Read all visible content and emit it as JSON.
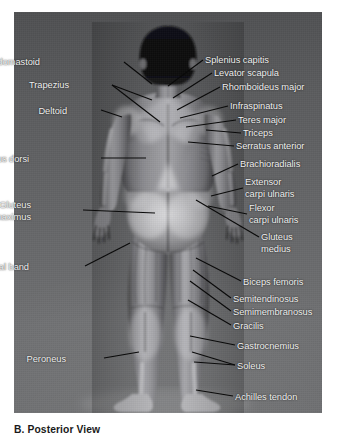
{
  "figure": {
    "caption": "B. Posterior View",
    "view_type": "Posterior View",
    "panel_letter": "B.",
    "colors": {
      "background_top": "#4f5052",
      "background_bottom": "#6e6f71",
      "label_text": "#f2f2f2",
      "leader_line": "#0a0a0a",
      "caption_text": "#1a1a1a",
      "page_background": "#ffffff"
    }
  },
  "labels_left": [
    {
      "id": "sternocleidomastoid",
      "text": "Sternocleidomastoid",
      "x": 40,
      "y": 57
    },
    {
      "id": "trapezius",
      "text": "Trapezius",
      "x": 69,
      "y": 80
    },
    {
      "id": "deltoid",
      "text": "Deltoid",
      "x": 67,
      "y": 106
    },
    {
      "id": "latissimus-dorsi",
      "text": "Latissimus dorsi",
      "x": 29,
      "y": 154
    },
    {
      "id": "gluteus-maximus",
      "text": "Gluteus\nmaximus",
      "x": 31,
      "y": 200
    },
    {
      "id": "iliotibial-band",
      "text": "Iliotibial band",
      "x": 29,
      "y": 262
    },
    {
      "id": "peroneus",
      "text": "Peroneus",
      "x": 66,
      "y": 354
    }
  ],
  "labels_right": [
    {
      "id": "splenius-capitis",
      "text": "Splenius capitis",
      "x": 205,
      "y": 55
    },
    {
      "id": "levator-scapula",
      "text": "Levator scapula",
      "x": 214,
      "y": 68
    },
    {
      "id": "rhomboideus-major",
      "text": "Rhomboideus major",
      "x": 222,
      "y": 82
    },
    {
      "id": "infraspinatus",
      "text": "Infraspinatus",
      "x": 230,
      "y": 101
    },
    {
      "id": "teres-major",
      "text": "Teres major",
      "x": 238,
      "y": 115
    },
    {
      "id": "triceps",
      "text": "Triceps",
      "x": 243,
      "y": 128
    },
    {
      "id": "serratus-anterior",
      "text": "Serratus anterior",
      "x": 236,
      "y": 141
    },
    {
      "id": "brachioradialis",
      "text": "Brachioradialis",
      "x": 240,
      "y": 159
    },
    {
      "id": "extensor-carpi-ulnaris",
      "text": "Extensor\ncarpi ulnaris",
      "x": 245,
      "y": 177
    },
    {
      "id": "flexor-carpi-ulnaris",
      "text": "Flexor\ncarpi ulnaris",
      "x": 249,
      "y": 203
    },
    {
      "id": "gluteus-medius",
      "text": "Gluteus\nmedius",
      "x": 261,
      "y": 232
    },
    {
      "id": "biceps-femoris",
      "text": "Biceps femoris",
      "x": 243,
      "y": 277
    },
    {
      "id": "semitendinosus",
      "text": "Semitendinosus",
      "x": 233,
      "y": 294
    },
    {
      "id": "semimembranosus",
      "text": "Semimembranosus",
      "x": 233,
      "y": 307
    },
    {
      "id": "gracilis",
      "text": "Gracilis",
      "x": 233,
      "y": 321
    },
    {
      "id": "gastrocnemius",
      "text": "Gastrocnemius",
      "x": 237,
      "y": 341
    },
    {
      "id": "soleus",
      "text": "Soleus",
      "x": 237,
      "y": 361
    },
    {
      "id": "achilles-tendon",
      "text": "Achilles tendon",
      "x": 235,
      "y": 392
    }
  ],
  "leader_lines": [
    {
      "id": "leader-sternocleidomastoid",
      "x1": 124,
      "y1": 62,
      "x2": 152,
      "y2": 84
    },
    {
      "id": "leader-trapezius-a",
      "x1": 112,
      "y1": 85,
      "x2": 152,
      "y2": 100
    },
    {
      "id": "leader-trapezius-b",
      "x1": 112,
      "y1": 85,
      "x2": 160,
      "y2": 122
    },
    {
      "id": "leader-deltoid",
      "x1": 101,
      "y1": 110,
      "x2": 122,
      "y2": 117
    },
    {
      "id": "leader-latissimus-dorsi",
      "x1": 101,
      "y1": 158,
      "x2": 146,
      "y2": 158
    },
    {
      "id": "leader-gluteus-maximus",
      "x1": 83,
      "y1": 210,
      "x2": 155,
      "y2": 213
    },
    {
      "id": "leader-iliotibial-band",
      "x1": 85,
      "y1": 266,
      "x2": 130,
      "y2": 243
    },
    {
      "id": "leader-peroneus",
      "x1": 104,
      "y1": 358,
      "x2": 139,
      "y2": 352
    },
    {
      "id": "leader-splenius-capitis",
      "x1": 203,
      "y1": 60,
      "x2": 168,
      "y2": 86
    },
    {
      "id": "leader-levator-scapula",
      "x1": 212,
      "y1": 73,
      "x2": 173,
      "y2": 98
    },
    {
      "id": "leader-rhomboideus-major",
      "x1": 220,
      "y1": 87,
      "x2": 177,
      "y2": 110
    },
    {
      "id": "leader-infraspinatus",
      "x1": 228,
      "y1": 106,
      "x2": 180,
      "y2": 118
    },
    {
      "id": "leader-teres-major",
      "x1": 236,
      "y1": 120,
      "x2": 186,
      "y2": 127
    },
    {
      "id": "leader-triceps",
      "x1": 241,
      "y1": 133,
      "x2": 206,
      "y2": 130
    },
    {
      "id": "leader-serratus-anterior",
      "x1": 234,
      "y1": 146,
      "x2": 188,
      "y2": 142
    },
    {
      "id": "leader-brachioradialis",
      "x1": 238,
      "y1": 164,
      "x2": 212,
      "y2": 176
    },
    {
      "id": "leader-extensor-carpi",
      "x1": 243,
      "y1": 188,
      "x2": 211,
      "y2": 196
    },
    {
      "id": "leader-flexor-carpi",
      "x1": 247,
      "y1": 214,
      "x2": 208,
      "y2": 206
    },
    {
      "id": "leader-gluteus-medius",
      "x1": 259,
      "y1": 237,
      "x2": 196,
      "y2": 200
    },
    {
      "id": "leader-biceps-femoris",
      "x1": 241,
      "y1": 281,
      "x2": 196,
      "y2": 258
    },
    {
      "id": "leader-semitendinosus",
      "x1": 231,
      "y1": 298,
      "x2": 193,
      "y2": 270
    },
    {
      "id": "leader-semimembranosus",
      "x1": 231,
      "y1": 311,
      "x2": 190,
      "y2": 281
    },
    {
      "id": "leader-gracilis",
      "x1": 231,
      "y1": 325,
      "x2": 188,
      "y2": 300
    },
    {
      "id": "leader-gastrocnemius",
      "x1": 235,
      "y1": 345,
      "x2": 190,
      "y2": 336
    },
    {
      "id": "leader-soleus-a",
      "x1": 235,
      "y1": 365,
      "x2": 192,
      "y2": 352
    },
    {
      "id": "leader-soleus-b",
      "x1": 235,
      "y1": 365,
      "x2": 194,
      "y2": 362
    },
    {
      "id": "leader-achilles-tendon",
      "x1": 233,
      "y1": 396,
      "x2": 196,
      "y2": 390
    }
  ]
}
